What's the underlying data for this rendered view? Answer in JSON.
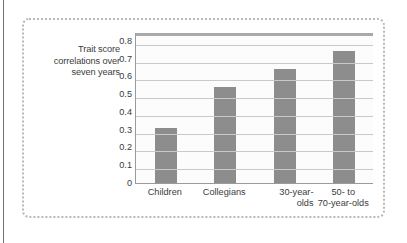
{
  "figure": {
    "axis_caption": "Trait score correlations over seven years",
    "bar_color": "#8d8d8d",
    "gridline_color": "#c9c9c9",
    "frame_color": "#b9b9b9",
    "plot_background": "#fcfcfc"
  },
  "chart_data": {
    "type": "bar",
    "title": "",
    "xlabel": "",
    "ylabel": "Trait score correlations over seven years",
    "categories": [
      "Children",
      "Collegians",
      "30-year-olds",
      "50- to 70-year-olds"
    ],
    "category_display": [
      "Children",
      "Collegians",
      "30-year-\nolds",
      "50- to\n70-year-olds"
    ],
    "values": [
      0.31,
      0.54,
      0.64,
      0.745
    ],
    "ylim": [
      0,
      0.85
    ],
    "yticks": [
      0,
      0.1,
      0.2,
      0.3,
      0.4,
      0.5,
      0.6,
      0.7,
      0.8
    ],
    "ytick_labels": [
      "0",
      "0.1",
      "0.2",
      "0.3",
      "0.4",
      "0.5",
      "0.6",
      "0.7",
      "0.8"
    ],
    "grid": true,
    "legend": "none",
    "series": [
      {
        "name": "Trait score correlations over seven years",
        "values": [
          0.31,
          0.54,
          0.64,
          0.745
        ]
      }
    ]
  }
}
